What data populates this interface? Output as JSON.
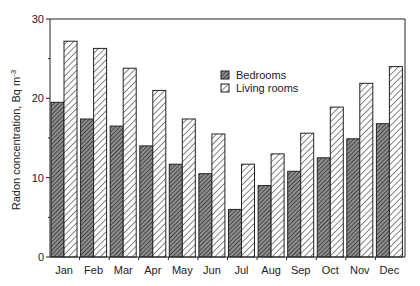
{
  "chart_data": {
    "type": "bar",
    "title": "",
    "xlabel": "",
    "ylabel": "Radon concentration, Bq m",
    "ylabel_superscript": "-3",
    "ylim": [
      0,
      30
    ],
    "yticks": [
      0,
      10,
      20,
      30
    ],
    "yminor_ticks": [
      5,
      15,
      25
    ],
    "grid": false,
    "legend_position": "upper center-right, inside plot",
    "categories": [
      "Jan",
      "Feb",
      "Mar",
      "Apr",
      "May",
      "Jun",
      "Jul",
      "Aug",
      "Sep",
      "Oct",
      "Nov",
      "Dec"
    ],
    "series": [
      {
        "name": "Bedrooms",
        "pattern": "dense-dark-hatch",
        "values": [
          19.5,
          17.4,
          16.5,
          14.0,
          11.7,
          10.5,
          6.0,
          9.0,
          10.8,
          12.5,
          14.9,
          16.8
        ]
      },
      {
        "name": "Living rooms",
        "pattern": "light-diagonal-hatch",
        "values": [
          27.2,
          26.3,
          23.8,
          21.0,
          17.4,
          15.5,
          11.7,
          13.0,
          15.6,
          18.9,
          21.9,
          24.0
        ]
      }
    ]
  },
  "legend": {
    "items": [
      {
        "label": "Bedrooms"
      },
      {
        "label": "Living rooms"
      }
    ]
  },
  "axis": {
    "y_title": "Radon concentration, Bq m",
    "y_title_sup": "-3",
    "y_tick_labels": [
      "0",
      "10",
      "20",
      "30"
    ]
  },
  "colors": {
    "frame": "#222222",
    "bedroom_hatch": "#3a3a3a",
    "bedroom_bg": "#9a9a9a",
    "living_hatch": "#444444",
    "living_bg": "#ffffff"
  }
}
